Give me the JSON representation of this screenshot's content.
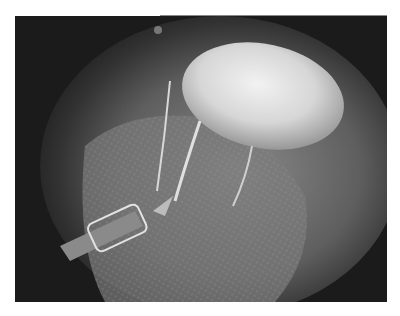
{
  "image": {
    "description": "Grayscale arthroscopic view: bright rounded structure at upper right, textured tissue surface, thin sutures, and a metal instrument at lower left",
    "colors": {
      "background": "#1b1b1b",
      "tissue": "#6e6e6e",
      "bright_structure": "#e6e6e6",
      "page": "#ffffff"
    }
  }
}
